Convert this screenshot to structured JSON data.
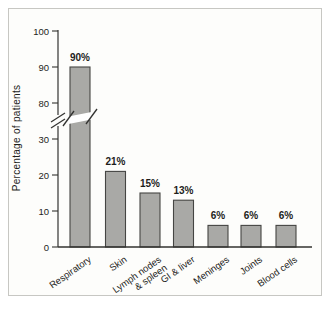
{
  "chart_data": {
    "type": "bar",
    "title": "",
    "ylabel": "Percentage of patients",
    "xlabel": "",
    "categories": [
      [
        "Respiratory"
      ],
      [
        "Skin"
      ],
      [
        "Lymph nodes",
        "& spleen"
      ],
      [
        "GI & liver"
      ],
      [
        "Meninges"
      ],
      [
        "Joints"
      ],
      [
        "Blood cells"
      ]
    ],
    "values": [
      90,
      21,
      15,
      13,
      6,
      6,
      6
    ],
    "bar_labels": [
      "90%",
      "21%",
      "15%",
      "13%",
      "6%",
      "6%",
      "6%"
    ],
    "y_axis": {
      "lower_ticks": [
        0,
        10,
        20,
        30
      ],
      "upper_ticks": [
        80,
        90,
        100
      ],
      "break_between": [
        30,
        80
      ],
      "ylim": [
        0,
        100
      ]
    },
    "grid": false,
    "legend": "none",
    "colors": {
      "bar_fill": "#a9a9a6",
      "bar_stroke": "#454543",
      "axis": "#333331",
      "text": "#1e1e1c",
      "panel_background": "#fdfdfb",
      "panel_border": "#c7c7c3",
      "break_band": "#ffffff"
    }
  }
}
